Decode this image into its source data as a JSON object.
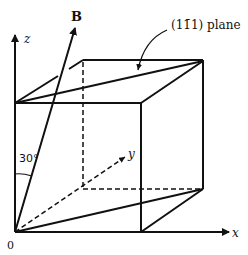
{
  "figure": {
    "labels": {
      "z_axis": "z",
      "x_axis": "x",
      "y_axis": "y",
      "origin": "0",
      "field_vector": "B",
      "angle": "30°",
      "plane_prefix": "(1",
      "plane_bar": "1̄",
      "plane_suffix": "1) plane",
      "plane_full": "(11̄1) plane"
    },
    "caption_partial": "...of the magnetic field B..."
  },
  "colors": {
    "line": "#111111",
    "background": "#ffffff"
  }
}
